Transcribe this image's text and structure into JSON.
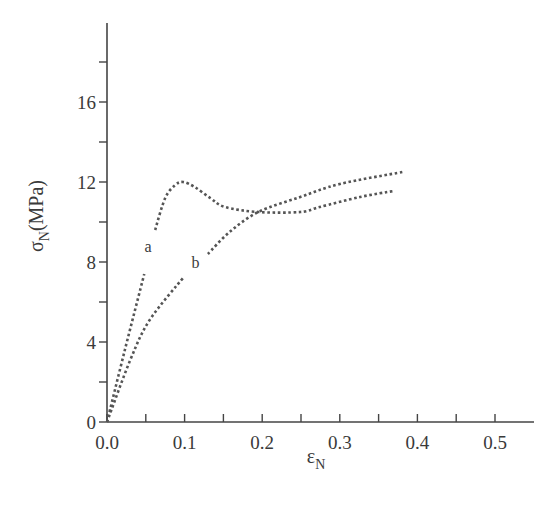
{
  "chart_data": {
    "type": "line",
    "title": "",
    "xlabel": "εN",
    "xlabel_main": "ε",
    "xlabel_sub": "N",
    "ylabel": "σN(MPa)",
    "ylabel_main": "σ",
    "ylabel_sub": "N",
    "ylabel_unit": "(MPa)",
    "xlim": [
      0,
      0.55
    ],
    "ylim": [
      0,
      20
    ],
    "grid": false,
    "legend": "none (inline curve labels)",
    "x_ticks": [
      0.0,
      0.1,
      0.2,
      0.3,
      0.4,
      0.5
    ],
    "x_tick_labels": [
      "0.0",
      "0.1",
      "0.2",
      "0.3",
      "0.4",
      "0.5"
    ],
    "x_minor_ticks": [
      0.05,
      0.15,
      0.25,
      0.35,
      0.45
    ],
    "y_ticks": [
      0,
      4,
      8,
      12,
      16
    ],
    "y_tick_labels": [
      "0",
      "4",
      "8",
      "12",
      "16"
    ],
    "y_minor_ticks": [
      2,
      6,
      10,
      14,
      18
    ],
    "series": [
      {
        "name": "a",
        "style": "dotted",
        "label_pos": [
          0.053,
          8.5
        ],
        "segments": [
          [
            [
              0,
              0
            ],
            [
              0.023,
              3.6
            ],
            [
              0.048,
              7.4
            ]
          ],
          [
            [
              0.062,
              9.6
            ],
            [
              0.075,
              11.2
            ],
            [
              0.088,
              11.85
            ],
            [
              0.098,
              12.0
            ],
            [
              0.113,
              11.75
            ],
            [
              0.133,
              11.2
            ],
            [
              0.152,
              10.75
            ],
            [
              0.195,
              10.5
            ],
            [
              0.249,
              10.5
            ],
            [
              0.274,
              10.75
            ],
            [
              0.326,
              11.25
            ],
            [
              0.369,
              11.55
            ]
          ]
        ]
      },
      {
        "name": "b",
        "style": "dotted",
        "label_pos": [
          0.114,
          7.7
        ],
        "segments": [
          [
            [
              0,
              0
            ],
            [
              0.03,
              3.1
            ],
            [
              0.055,
              5.1
            ],
            [
              0.099,
              7.25
            ]
          ],
          [
            [
              0.13,
              8.4
            ],
            [
              0.158,
              9.5
            ],
            [
              0.195,
              10.5
            ],
            [
              0.249,
              11.25
            ],
            [
              0.3,
              11.9
            ],
            [
              0.381,
              12.5
            ]
          ]
        ]
      }
    ]
  }
}
